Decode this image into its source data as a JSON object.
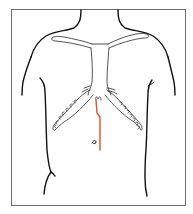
{
  "figure": {
    "title": "Anterior torso with midline incision line",
    "colors": {
      "background": "#ffffff",
      "frame": "#6e6e6e",
      "outline": "#1a1a1a",
      "incision": "#e0502a"
    },
    "frame": {
      "x": 11,
      "y": 9,
      "width": 174,
      "height": 196
    },
    "elements": [
      {
        "id": "neck",
        "label": "neck"
      },
      {
        "id": "shoulders",
        "label": "shoulders"
      },
      {
        "id": "clavicles",
        "label": "clavicles"
      },
      {
        "id": "sternum",
        "label": "sternum"
      },
      {
        "id": "costal-margin-left",
        "label": "left costal margin"
      },
      {
        "id": "costal-margin-right",
        "label": "right costal margin"
      },
      {
        "id": "umbilicus",
        "label": "umbilicus"
      },
      {
        "id": "incision-line",
        "label": "incision line"
      }
    ],
    "incision": {
      "points": [
        [
          96,
          100
        ],
        [
          97,
          113
        ],
        [
          100,
          117
        ],
        [
          100,
          150
        ]
      ]
    },
    "umbilicus": {
      "x": 94,
      "y": 142
    }
  }
}
